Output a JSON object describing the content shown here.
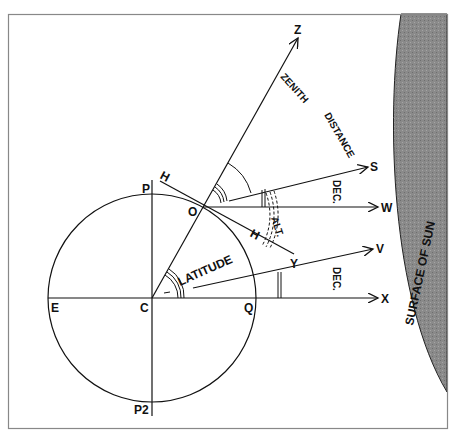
{
  "diagram": {
    "points": {
      "zenith": "Z",
      "sun_ray": "S",
      "w_ray": "W",
      "v_ray": "V",
      "x_ray": "X",
      "y_ray": "Y",
      "horizon_upper": "H",
      "horizon_lower": "H",
      "observer": "O",
      "pole_north": "P",
      "pole_south": "P2",
      "east": "E",
      "center": "C",
      "equator": "Q"
    },
    "labels": {
      "zenith_distance_1": "ZENITH",
      "zenith_distance_2": "DISTANCE",
      "declination_upper": "DEC.",
      "declination_lower": "DEC.",
      "altitude": "ALT.",
      "latitude": "LATITUDE",
      "sun_surface": "SURFACE OF SUN"
    },
    "colors": {
      "line": "#111111",
      "sun_fill": "#8a8a8a",
      "frame": "#888888"
    }
  }
}
